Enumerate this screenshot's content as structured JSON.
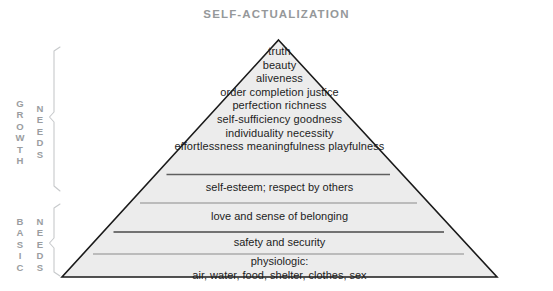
{
  "header": {
    "title": "SELF-ACTUALIZATION"
  },
  "diagram": {
    "name": "maslow-hierarchy-of-needs-pyramid",
    "fill_color": "#ececec",
    "stroke_color": "#1a1a1a",
    "divider_color": "#6d6d6d",
    "label_color": "#9a9da0",
    "text_color": "#1d1d1d"
  },
  "side_labels": {
    "growth": {
      "word": "GROWTH",
      "letters": [
        "G",
        "R",
        "O",
        "W",
        "T",
        "H"
      ],
      "needs": "NEEDS",
      "needs_letters": [
        "N",
        "E",
        "E",
        "D",
        "S"
      ]
    },
    "basic": {
      "word": "BASIC",
      "letters": [
        "B",
        "A",
        "S",
        "I",
        "C"
      ],
      "needs": "NEEDS",
      "needs_letters": [
        "N",
        "E",
        "E",
        "D",
        "S"
      ]
    }
  },
  "tiers": [
    {
      "id": "growth",
      "name": "self-actualization-growth-tier",
      "lines": [
        "truth",
        "beauty",
        "aliveness",
        "order  completion  justice",
        "perfection   richness",
        "self-sufficiency   goodness",
        "individuality   necessity",
        "effortlessness  meaningfulness  playfulness"
      ]
    },
    {
      "id": "esteem",
      "name": "esteem-tier",
      "lines": [
        "self-esteem; respect by others"
      ]
    },
    {
      "id": "love",
      "name": "love-belonging-tier",
      "lines": [
        "love and sense of belonging"
      ]
    },
    {
      "id": "safety",
      "name": "safety-tier",
      "lines": [
        "safety and security"
      ]
    },
    {
      "id": "physiologic",
      "name": "physiologic-tier",
      "lines": [
        "physiologic:",
        "air, water, food, shelter, clothes, sex"
      ]
    }
  ]
}
